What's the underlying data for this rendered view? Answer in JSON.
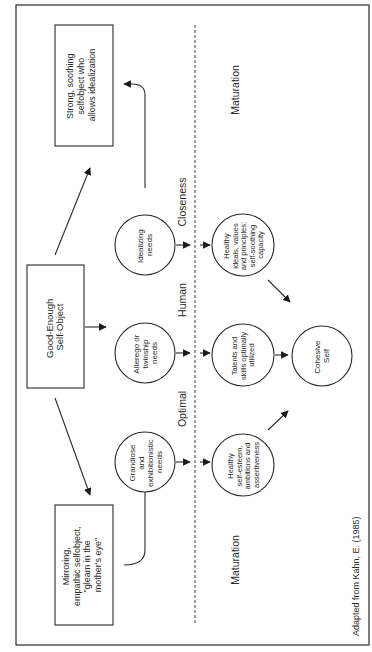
{
  "diagram": {
    "source_credit": "Adapted from Kahn, E. (1985)",
    "boxes": {
      "idealization": [
        "Strong, soothing",
        "selfobject who",
        "allows idealization"
      ],
      "good_enough": [
        "Good-Enough",
        "Self-Object"
      ],
      "mirroring": [
        "Mirroring,",
        "empathic selfobject,",
        "\"gleam in the",
        "mother's eye\""
      ]
    },
    "needs": {
      "idealizing": [
        "Idealizing",
        "needs"
      ],
      "alterego": [
        "Alterego or",
        "twinship",
        "needs"
      ],
      "grandiose": [
        "Grandiose",
        "and",
        "exhibitionistic",
        "needs"
      ]
    },
    "outcomes": {
      "ideals": [
        "Healthy",
        "ideals, values",
        "and principles;",
        "self-soothing",
        "capacity"
      ],
      "talents": [
        "Talents and",
        "skills optimally",
        "utilized"
      ],
      "self_esteem": [
        "Healthy",
        "self-esteem,",
        "ambitions and",
        "assertiveness"
      ]
    },
    "center": [
      "Cohesive",
      "Self"
    ],
    "band_labels": {
      "closeness": "Closeness",
      "human": "Human",
      "optimal": "Optimal"
    },
    "maturation_top": "Maturation",
    "maturation_bottom": "Maturation",
    "colors": {
      "ink": "#2a2a2a",
      "background": "#ffffff"
    }
  }
}
